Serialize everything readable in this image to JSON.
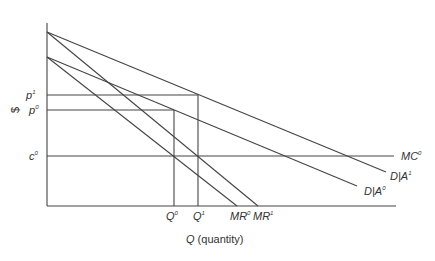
{
  "diagram": {
    "type": "monopoly advertising effect on demand",
    "y_axis_label": "$",
    "x_axis_label_var": "Q",
    "x_axis_label_rest": " (quantity)",
    "y_ticks": [
      {
        "base": "p",
        "sup": "1",
        "y": 95
      },
      {
        "base": "p",
        "sup": "0",
        "y": 110
      },
      {
        "base": "c",
        "sup": "0",
        "y": 156
      }
    ],
    "x_ticks": [
      {
        "base": "Q",
        "sup": "0",
        "x": 174
      },
      {
        "base": "Q",
        "sup": "1",
        "x": 198
      },
      {
        "base": "MR",
        "sup": "0",
        "x": 237
      },
      {
        "base": "MR",
        "sup": "1",
        "x": 258
      }
    ],
    "curves": [
      {
        "name": "D|A1",
        "base": "D|A",
        "sup": "1",
        "from": [
          47,
          32
        ],
        "to": [
          386,
          172
        ]
      },
      {
        "name": "MR1",
        "from": [
          47,
          32
        ],
        "to": [
          258,
          206
        ]
      },
      {
        "name": "D|A0",
        "base": "D|A",
        "sup": "0",
        "from": [
          47,
          57
        ],
        "to": [
          357,
          186
        ]
      },
      {
        "name": "MR0",
        "from": [
          47,
          57
        ],
        "to": [
          237,
          206
        ]
      },
      {
        "name": "MC0",
        "base": "MC",
        "sup": "0",
        "from": [
          47,
          156
        ],
        "to": [
          394,
          156
        ]
      }
    ],
    "labels": {
      "mc": {
        "base": "MC",
        "sup": "0"
      },
      "da1": {
        "base": "D|A",
        "sup": "1"
      },
      "da0": {
        "base": "D|A",
        "sup": "0"
      },
      "p1": {
        "base": "p",
        "sup": "1"
      },
      "p0": {
        "base": "p",
        "sup": "0"
      },
      "c0": {
        "base": "c",
        "sup": "0"
      },
      "q0": {
        "base": "Q",
        "sup": "0"
      },
      "q1": {
        "base": "Q",
        "sup": "1"
      },
      "mr0": {
        "base": "MR",
        "sup": "0"
      },
      "mr1": {
        "base": "MR",
        "sup": "1"
      }
    }
  }
}
